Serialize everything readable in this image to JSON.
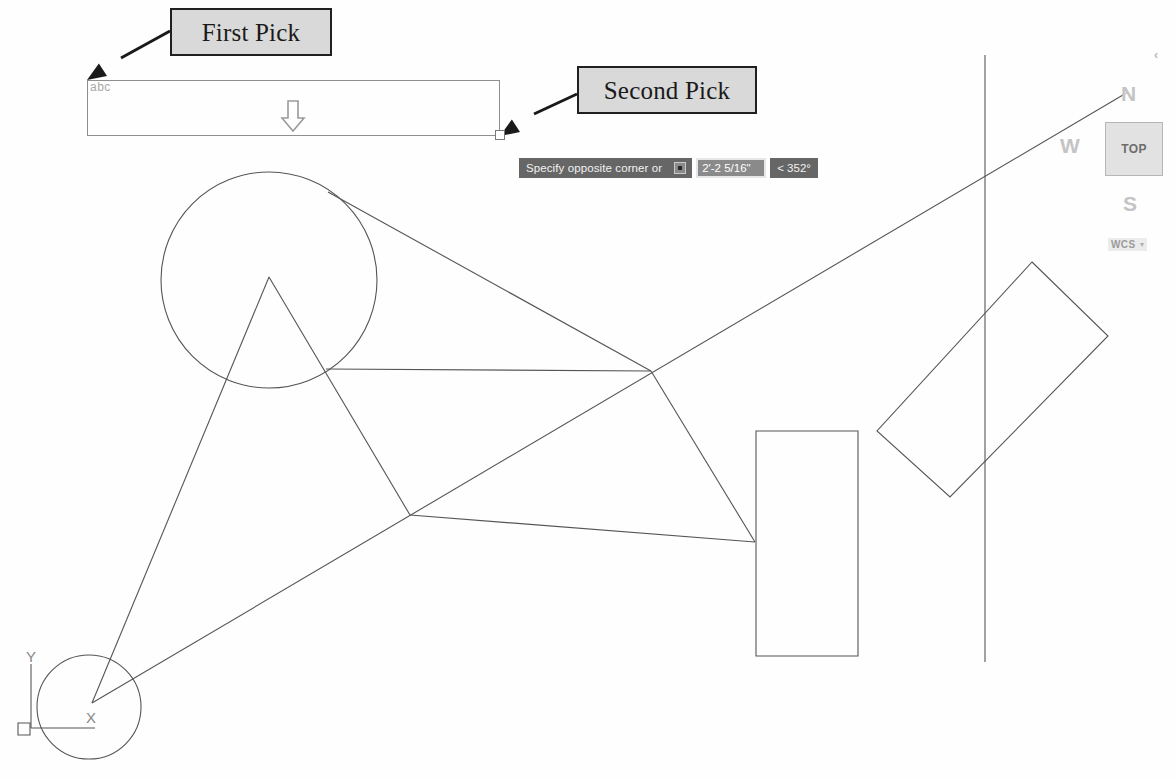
{
  "app": {
    "title": "AutoCAD drawing area — crossing window selection",
    "background_color": "#fefefe",
    "geometry_color": "#555555"
  },
  "callouts": [
    {
      "id": "first-pick",
      "label": "First Pick"
    },
    {
      "id": "second-pick",
      "label": "Second Pick"
    }
  ],
  "selection": {
    "label": "abc",
    "rect_border_color": "#8e8e8e",
    "arrow_glyph": "down-arrow"
  },
  "command_tooltip": {
    "prompt": "Specify opposite corner or",
    "options_icon": "options-square-icon",
    "distance_value": "2'-2 5/16\"",
    "angle_value": "< 352°",
    "background_color": "#666666",
    "field_background_color": "#8a8a8a"
  },
  "viewcube": {
    "face_label": "TOP",
    "compass": {
      "north": "N",
      "west": "W",
      "south": "S"
    },
    "coordinate_system": "WCS",
    "caret": "▾",
    "corner_glyph": "‹"
  },
  "ucs_icon": {
    "x_label": "X",
    "y_label": "Y"
  },
  "chart_data": {
    "type": "scatter",
    "xlabel": "",
    "ylabel": "",
    "xlim": [
      0,
      1176
    ],
    "ylim": [
      0,
      778
    ],
    "grid": false,
    "legend": "none",
    "shapes": [
      {
        "name": "upper-circle",
        "kind": "circle",
        "cx": 269,
        "cy": 280,
        "r": 108
      },
      {
        "name": "ucs-origin-circle",
        "kind": "circle",
        "cx": 89,
        "cy": 707,
        "r": 52
      },
      {
        "name": "triangle-peak-line-left",
        "kind": "polyline",
        "points": [
          [
            269,
            277
          ],
          [
            92,
            703
          ]
        ]
      },
      {
        "name": "triangle-peak-line-right",
        "kind": "polyline",
        "points": [
          [
            269,
            277
          ],
          [
            410,
            515
          ]
        ]
      },
      {
        "name": "chord-upper-right",
        "kind": "polyline",
        "points": [
          [
            328,
            192
          ],
          [
            651,
            371
          ]
        ]
      },
      {
        "name": "chord-mid",
        "kind": "polyline",
        "points": [
          [
            326,
            369
          ],
          [
            651,
            371
          ]
        ]
      },
      {
        "name": "vertex-to-lower-right",
        "kind": "polyline",
        "points": [
          [
            651,
            371
          ],
          [
            755,
            542
          ]
        ]
      },
      {
        "name": "long-diagonal",
        "kind": "polyline",
        "points": [
          [
            92,
            703
          ],
          [
            1128,
            92
          ]
        ]
      },
      {
        "name": "lower-left-to-rect",
        "kind": "polyline",
        "points": [
          [
            410,
            515
          ],
          [
            755,
            542
          ]
        ]
      },
      {
        "name": "tall-rectangle",
        "kind": "rect",
        "points": [
          [
            756,
            431
          ],
          [
            858,
            431
          ],
          [
            858,
            656
          ],
          [
            756,
            656
          ]
        ]
      },
      {
        "name": "rotated-rectangle",
        "kind": "polygon",
        "points": [
          [
            1032,
            262
          ],
          [
            1108,
            336
          ],
          [
            950,
            497
          ],
          [
            877,
            431
          ]
        ]
      },
      {
        "name": "vertical-line",
        "kind": "polyline",
        "points": [
          [
            985,
            55
          ],
          [
            985,
            662
          ]
        ]
      },
      {
        "name": "ucs-y-axis",
        "kind": "polyline",
        "points": [
          [
            31,
            664
          ],
          [
            31,
            728
          ]
        ]
      },
      {
        "name": "ucs-x-axis",
        "kind": "polyline",
        "points": [
          [
            31,
            728
          ],
          [
            95,
            728
          ]
        ]
      },
      {
        "name": "ucs-origin-box",
        "kind": "rect",
        "points": [
          [
            18,
            723
          ],
          [
            30,
            723
          ],
          [
            30,
            735
          ],
          [
            18,
            735
          ]
        ]
      }
    ],
    "annotation_arrows": [
      {
        "name": "first-pick-arrow",
        "from": [
          170,
          31
        ],
        "to": [
          87,
          80
        ]
      },
      {
        "name": "second-pick-arrow",
        "from": [
          577,
          94
        ],
        "to": [
          500,
          136
        ]
      }
    ]
  }
}
